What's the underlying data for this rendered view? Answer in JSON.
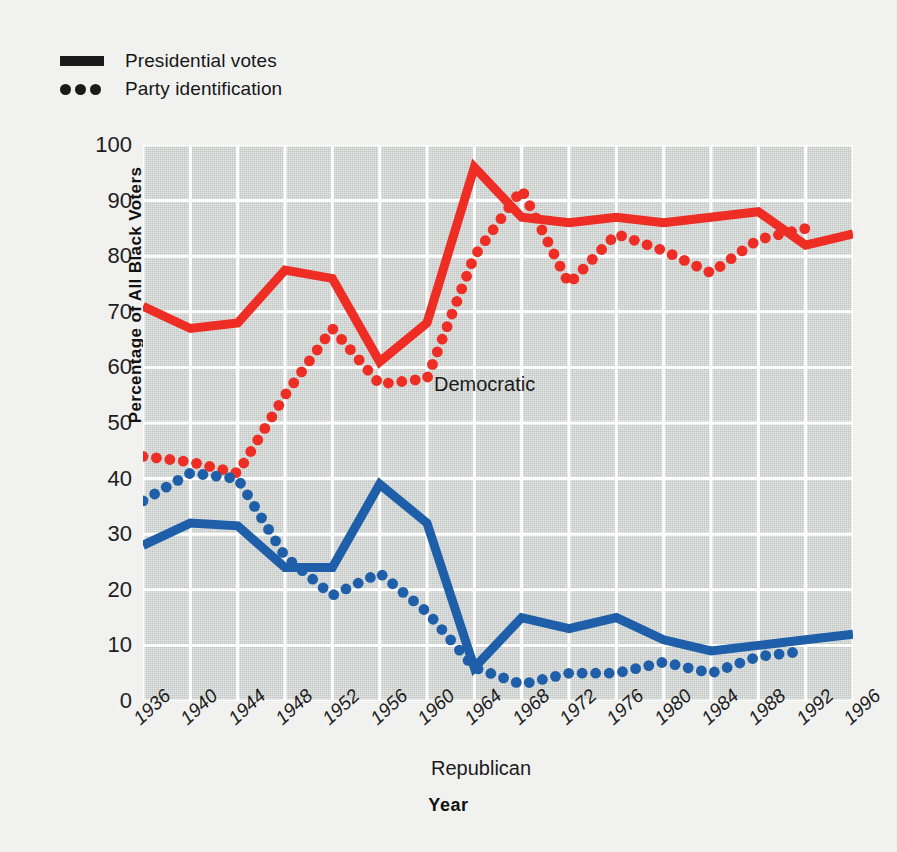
{
  "legend": {
    "items": [
      {
        "label": "Presidential votes",
        "key": "solid-line-swatch"
      },
      {
        "label": "Party identification",
        "key": "dotted-line-swatch"
      }
    ]
  },
  "axis": {
    "y_title": "Percentage of All Black Voters",
    "x_title": "Year"
  },
  "series_labels": {
    "democratic": "Democratic",
    "republican": "Republican"
  },
  "colors": {
    "democratic": "#ee2d24",
    "republican": "#1f5fa9",
    "plot_background": "#c8cdca",
    "gridlines": "#ffffff",
    "page_background": "#f4f5f3",
    "text": "#1a1a1a"
  },
  "chart_data": {
    "type": "line",
    "title": "",
    "xlabel": "Year",
    "ylabel": "Percentage of All Black Voters",
    "xlim": [
      1936,
      1996
    ],
    "ylim": [
      0,
      100
    ],
    "ytick_step": 10,
    "yticks": [
      0,
      10,
      20,
      30,
      40,
      50,
      60,
      70,
      80,
      90,
      100
    ],
    "x": [
      1936,
      1940,
      1944,
      1948,
      1952,
      1956,
      1960,
      1964,
      1968,
      1972,
      1976,
      1980,
      1984,
      1988,
      1992,
      1996
    ],
    "categories": [
      "1936",
      "1940",
      "1944",
      "1948",
      "1952",
      "1956",
      "1960",
      "1964",
      "1968",
      "1972",
      "1976",
      "1980",
      "1984",
      "1988",
      "1992",
      "1996"
    ],
    "grid": true,
    "legend_position": "top-left",
    "series": [
      {
        "name": "Democratic presidential votes",
        "party": "Democratic",
        "measure": "Presidential votes",
        "style": "solid",
        "color": "#ee2d24",
        "x": [
          1936,
          1940,
          1944,
          1948,
          1952,
          1956,
          1960,
          1964,
          1968,
          1972,
          1976,
          1980,
          1984,
          1988,
          1992,
          1996
        ],
        "values": [
          71,
          67,
          68,
          77.5,
          76,
          61,
          68,
          96,
          87,
          86,
          87,
          86,
          87,
          88,
          82,
          84
        ]
      },
      {
        "name": "Republican presidential votes",
        "party": "Republican",
        "measure": "Presidential votes",
        "style": "solid",
        "color": "#1f5fa9",
        "x": [
          1936,
          1940,
          1944,
          1948,
          1952,
          1956,
          1960,
          1964,
          1968,
          1972,
          1976,
          1980,
          1984,
          1988,
          1992,
          1996
        ],
        "values": [
          28,
          32,
          31.5,
          24,
          24,
          39,
          32,
          6,
          15,
          13,
          15,
          11,
          9,
          10,
          11,
          12
        ]
      },
      {
        "name": "Democratic party identification",
        "party": "Democratic",
        "measure": "Party identification",
        "style": "dotted",
        "color": "#ee2d24",
        "x": [
          1936,
          1940,
          1944,
          1948,
          1952,
          1956,
          1960,
          1964,
          1968,
          1972,
          1976,
          1980,
          1984,
          1988,
          1992
        ],
        "values": [
          44,
          43,
          41,
          55,
          67,
          57,
          58,
          80,
          92,
          75,
          84,
          81,
          77,
          83,
          85
        ]
      },
      {
        "name": "Republican party identification",
        "party": "Republican",
        "measure": "Party identification",
        "style": "dotted",
        "color": "#1f5fa9",
        "x": [
          1936,
          1940,
          1944,
          1948,
          1952,
          1956,
          1960,
          1964,
          1968,
          1972,
          1976,
          1980,
          1984,
          1988,
          1992
        ],
        "values": [
          36,
          41,
          40,
          26,
          19,
          23,
          16,
          6,
          3,
          5,
          5,
          7,
          5,
          8,
          9
        ]
      }
    ]
  }
}
